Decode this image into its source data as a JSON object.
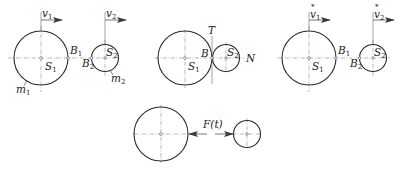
{
  "figure": {
    "panels": [
      {
        "id": "before-impact",
        "velocity_labels": [
          {
            "sym": "v",
            "sub": "1"
          },
          {
            "sym": "v",
            "sub": "2"
          }
        ],
        "center_labels": [
          {
            "sym": "S",
            "sub": "1"
          },
          {
            "sym": "S",
            "sub": "2"
          }
        ],
        "contact_labels": [
          {
            "sym": "B",
            "sub": "1"
          },
          {
            "sym": "B",
            "sub": "2"
          }
        ],
        "mass_labels": [
          {
            "sym": "m",
            "sub": "1"
          },
          {
            "sym": "m",
            "sub": "2"
          }
        ]
      },
      {
        "id": "during-impact",
        "center_labels": [
          {
            "sym": "S",
            "sub": "1"
          },
          {
            "sym": "S",
            "sub": "2"
          }
        ],
        "contact_label": "B",
        "tangent_label": "T",
        "normal_label": "N"
      },
      {
        "id": "after-impact",
        "velocity_labels": [
          {
            "sym": "v",
            "sub": "1",
            "accent": "*"
          },
          {
            "sym": "v",
            "sub": "2",
            "accent": "*"
          }
        ],
        "center_labels": [
          {
            "sym": "S",
            "sub": "1"
          },
          {
            "sym": "S",
            "sub": "2"
          }
        ],
        "contact_labels": [
          {
            "sym": "B",
            "sub": "1"
          },
          {
            "sym": "B",
            "sub": "2"
          }
        ]
      },
      {
        "id": "impact-force",
        "force_label": "F(t)"
      }
    ]
  }
}
